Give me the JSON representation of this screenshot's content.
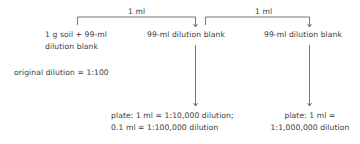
{
  "diagram": {
    "transfers": [
      {
        "label": "1 ml"
      },
      {
        "label": "1 ml"
      }
    ],
    "nodes": [
      {
        "line1": "1 g soil + 99-ml",
        "line2": "dilution blank"
      },
      {
        "line1": "99-ml dilution blank"
      },
      {
        "line1": "99-ml dilution blank"
      }
    ],
    "original_dilution": "original dilution = 1:100",
    "plates": [
      {
        "line1": "plate: 1 ml = 1:10,000 dilution;",
        "line2": "0.1 ml = 1:100,000 dilution"
      },
      {
        "line1": "plate: 1 ml =",
        "line2": "1:1,000,000 dilution"
      }
    ],
    "colors": {
      "line": "#555555",
      "text": "#3a3a3a"
    }
  }
}
